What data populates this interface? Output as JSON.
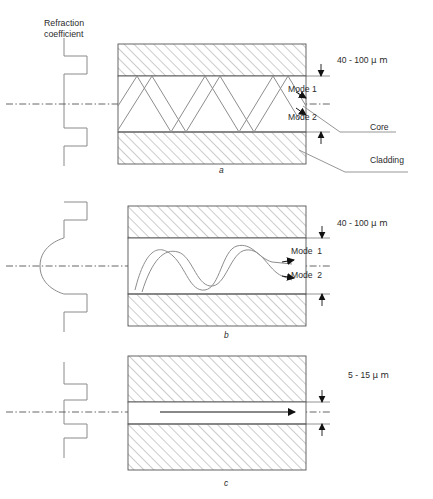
{
  "figure": {
    "axis_label": "Refraction\ncoefficient",
    "axis_label_line1": "Refraction",
    "axis_label_line2": "coefficient",
    "colors": {
      "ink": "#2b2b2b",
      "hatch": "#9a9a9a",
      "ray": "#8d8d8d",
      "centerline": "#555555",
      "background": "#ffffff"
    }
  },
  "panels": [
    {
      "id": "a",
      "caption": "a",
      "profile_type": "step-index",
      "core_diameter": "40 - 100 μm",
      "core_diameter_value": "40 - 100",
      "core_diameter_unit": "μ m",
      "propagation": "zigzag-rays",
      "mode_labels": [
        "Mode 1",
        "Mode 2"
      ],
      "callouts": [
        "Core",
        "Cladding"
      ]
    },
    {
      "id": "b",
      "caption": "b",
      "profile_type": "graded-index",
      "core_diameter": "40 - 100 μm",
      "core_diameter_value": "40 - 100",
      "core_diameter_unit": "μ m",
      "propagation": "sinusoidal-rays",
      "mode_labels": [
        "Mode  1",
        "Mode  2"
      ],
      "callouts": []
    },
    {
      "id": "c",
      "caption": "c",
      "profile_type": "step-index-narrow",
      "core_diameter": "5 - 15 μm",
      "core_diameter_value": "5 - 15",
      "core_diameter_unit": "μ m",
      "propagation": "straight-ray",
      "mode_labels": [],
      "callouts": []
    }
  ],
  "labels": {
    "dim_a": "40 - 100",
    "dim_b": "40 - 100",
    "dim_c": "5 - 15",
    "unit": "μ m",
    "mode1_a": "Mode 1",
    "mode2_a": "Mode 2",
    "mode1_b": "Mode  1",
    "mode2_b": "Mode  2",
    "core": "Core",
    "cladding": "Cladding",
    "caption_a": "a",
    "caption_b": "b",
    "caption_c": "c"
  }
}
